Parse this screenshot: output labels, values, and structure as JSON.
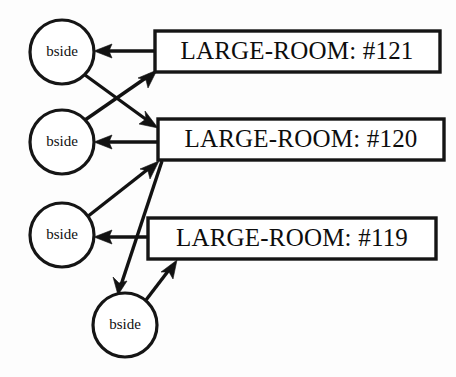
{
  "diagram": {
    "background_color": "#fdfdfd",
    "stroke_color": "#121212",
    "nodes": [
      {
        "id": "bside1",
        "shape": "circle",
        "label": "bside",
        "cx": 62,
        "cy": 52,
        "r": 32
      },
      {
        "id": "bside2",
        "shape": "circle",
        "label": "bside",
        "cx": 62,
        "cy": 142,
        "r": 32
      },
      {
        "id": "bside3",
        "shape": "circle",
        "label": "bside",
        "cx": 62,
        "cy": 235,
        "r": 32
      },
      {
        "id": "bside4",
        "shape": "circle",
        "label": "bside",
        "cx": 125,
        "cy": 325,
        "r": 32
      },
      {
        "id": "room121",
        "shape": "box",
        "label": "LARGE-ROOM: #121",
        "x": 155,
        "y": 31,
        "w": 285,
        "h": 41
      },
      {
        "id": "room120",
        "shape": "box",
        "label": "LARGE-ROOM: #120",
        "x": 158,
        "y": 119,
        "w": 286,
        "h": 41
      },
      {
        "id": "room119",
        "shape": "box",
        "label": "LARGE-ROOM: #119",
        "x": 148,
        "y": 218,
        "w": 288,
        "h": 41
      }
    ],
    "edges": [
      {
        "id": "e1",
        "from": "room121",
        "to": "bside1",
        "label": ""
      },
      {
        "id": "e2",
        "from": "bside1",
        "to": "room120",
        "label": ""
      },
      {
        "id": "e3",
        "from": "bside2",
        "to": "room121",
        "label": ""
      },
      {
        "id": "e4",
        "from": "room120",
        "to": "bside2",
        "label": ""
      },
      {
        "id": "e5",
        "from": "bside3",
        "to": "room120",
        "label": ""
      },
      {
        "id": "e6",
        "from": "room119",
        "to": "bside3",
        "label": ""
      },
      {
        "id": "e7",
        "from": "room120",
        "to": "bside4",
        "label": ""
      },
      {
        "id": "e8",
        "from": "bside4",
        "to": "room119",
        "label": ""
      }
    ]
  }
}
